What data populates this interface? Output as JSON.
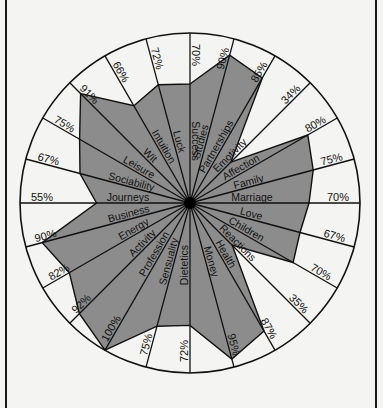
{
  "chart_data": {
    "type": "radar",
    "title": "",
    "center": [
      190,
      203
    ],
    "radius": 170,
    "start_angle_deg": 0,
    "direction": "clockwise",
    "max_value": 100,
    "fill_color": "#8c8c8c",
    "line_color": "#111111",
    "background_color": "#f4f4f2",
    "categories": [
      "Success",
      "Studies",
      "Partnerships",
      "Emotivity",
      "Affection",
      "Family",
      "Marriage",
      "Love",
      "Children",
      "Reactions",
      "Health",
      "Money",
      "Dietetics",
      "Sensuality",
      "Profession",
      "Activity",
      "Energy",
      "Business",
      "Journeys",
      "Sociability",
      "Leisure",
      "Wit",
      "Intuition",
      "Luck"
    ],
    "values": [
      70,
      90,
      85,
      34,
      80,
      75,
      70,
      67,
      70,
      35,
      87,
      95,
      72,
      75,
      100,
      92,
      82,
      90,
      55,
      67,
      75,
      91,
      66,
      72
    ],
    "value_labels": [
      "70%",
      "90%",
      "85%",
      "34%",
      "80%",
      "75%",
      "70%",
      "67%",
      "70%",
      "35%",
      "87%",
      "95%",
      "72%",
      "75%",
      "100%",
      "92%",
      "82%",
      "90%",
      "55%",
      "67%",
      "75%",
      "91%",
      "66%",
      "72%"
    ]
  }
}
